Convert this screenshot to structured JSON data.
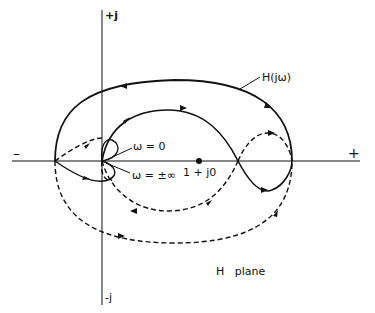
{
  "diagram": {
    "type": "Nyquist plot",
    "labels": {
      "imag_pos": "+j",
      "imag_neg": "-j",
      "real_neg": "–",
      "real_pos": "+",
      "curve": "H(jω)",
      "omega_zero": "ω = 0",
      "omega_inf": "ω = ±∞",
      "critical_point": "1 + j0",
      "plane": "H   plane"
    },
    "colors": {
      "stroke": "#111111",
      "background": "#ffffff"
    }
  }
}
